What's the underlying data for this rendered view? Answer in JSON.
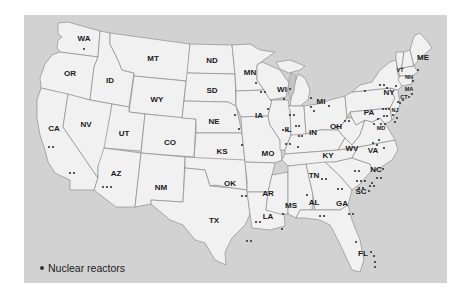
{
  "legend": {
    "label": "Nuclear reactors",
    "icon": "dot-marker"
  },
  "colors": {
    "background": "#d2d2d2",
    "state_fill": "#f1f1f1",
    "border": "#8e8e8e",
    "dot": "#333333"
  },
  "states": [
    {
      "abbr": "WA",
      "x": 60,
      "y": 22,
      "dots": 1
    },
    {
      "abbr": "OR",
      "x": 46,
      "y": 57,
      "dots": 0
    },
    {
      "abbr": "CA",
      "x": 31,
      "y": 114,
      "dots": 4
    },
    {
      "abbr": "ID",
      "x": 86,
      "y": 64,
      "dots": 0
    },
    {
      "abbr": "NV",
      "x": 62,
      "y": 110,
      "dots": 0
    },
    {
      "abbr": "MT",
      "x": 128,
      "y": 42,
      "dots": 0
    },
    {
      "abbr": "WY",
      "x": 133,
      "y": 85,
      "dots": 0
    },
    {
      "abbr": "UT",
      "x": 100,
      "y": 119,
      "dots": 0
    },
    {
      "abbr": "CO",
      "x": 146,
      "y": 128,
      "dots": 0
    },
    {
      "abbr": "AZ",
      "x": 92,
      "y": 160,
      "dots": 3
    },
    {
      "abbr": "NM",
      "x": 137,
      "y": 173,
      "dots": 0
    },
    {
      "abbr": "ND",
      "x": 188,
      "y": 45,
      "dots": 0
    },
    {
      "abbr": "SD",
      "x": 188,
      "y": 75,
      "dots": 0
    },
    {
      "abbr": "NE",
      "x": 189,
      "y": 106,
      "dots": 2
    },
    {
      "abbr": "KS",
      "x": 198,
      "y": 137,
      "dots": 1
    },
    {
      "abbr": "OK",
      "x": 206,
      "y": 168,
      "dots": 0
    },
    {
      "abbr": "TX",
      "x": 190,
      "y": 210,
      "dots": 4
    },
    {
      "abbr": "MN",
      "x": 226,
      "y": 57,
      "dots": 3
    },
    {
      "abbr": "IA",
      "x": 225,
      "y": 99,
      "dots": 1
    },
    {
      "abbr": "MO",
      "x": 244,
      "y": 139,
      "dots": 1
    },
    {
      "abbr": "AR",
      "x": 244,
      "y": 177,
      "dots": 2
    },
    {
      "abbr": "LA",
      "x": 245,
      "y": 202,
      "dots": 2
    },
    {
      "abbr": "WI",
      "x": 258,
      "y": 74,
      "dots": 4
    },
    {
      "abbr": "IL",
      "x": 270,
      "y": 114,
      "dots": 11
    },
    {
      "abbr": "MS",
      "x": 268,
      "y": 191,
      "dots": 1
    },
    {
      "abbr": "MI",
      "x": 298,
      "y": 86,
      "dots": 4
    },
    {
      "abbr": "IN",
      "x": 289,
      "y": 116,
      "dots": 0
    },
    {
      "abbr": "KY",
      "x": 304,
      "y": 142,
      "dots": 0
    },
    {
      "abbr": "TN",
      "x": 289,
      "y": 162,
      "dots": 2
    },
    {
      "abbr": "AL",
      "x": 290,
      "y": 187,
      "dots": 3
    },
    {
      "abbr": "GA",
      "x": 318,
      "y": 190,
      "dots": 4
    },
    {
      "abbr": "FL",
      "x": 340,
      "y": 253,
      "dots": 5
    },
    {
      "abbr": "OH",
      "x": 334,
      "y": 112,
      "dots": 3
    },
    {
      "abbr": "WV",
      "x": 352,
      "y": 135,
      "dots": 0
    },
    {
      "abbr": "VA",
      "x": 372,
      "y": 137,
      "dots": 4
    },
    {
      "abbr": "NC",
      "x": 373,
      "y": 168,
      "dots": 5
    },
    {
      "abbr": "SC",
      "x": 361,
      "y": 180,
      "dots": 7
    },
    {
      "abbr": "PA",
      "x": 368,
      "y": 97,
      "dots": 9
    },
    {
      "abbr": "NY",
      "x": 389,
      "y": 77,
      "dots": 6
    },
    {
      "abbr": "MD",
      "x": 381,
      "y": 112,
      "dots": 2
    },
    {
      "abbr": "NJ",
      "x": 395,
      "y": 98,
      "dots": 3
    },
    {
      "abbr": "VT",
      "x": 400,
      "y": 55,
      "dots": 1
    },
    {
      "abbr": "NH",
      "x": 407,
      "y": 63,
      "dots": 1
    },
    {
      "abbr": "MA",
      "x": 407,
      "y": 74,
      "dots": 1
    },
    {
      "abbr": "CT",
      "x": 403,
      "y": 83,
      "dots": 2
    },
    {
      "abbr": "ME",
      "x": 422,
      "y": 41,
      "dots": 1
    }
  ]
}
